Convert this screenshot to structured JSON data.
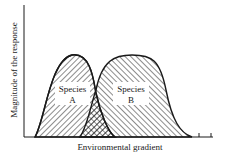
{
  "figure": {
    "y_axis_label": "Magnitude of the response",
    "x_axis_label": "Environmental gradient",
    "species": [
      {
        "name": "Species",
        "letter": "A",
        "hatch": "backslash"
      },
      {
        "name": "Species",
        "letter": "B",
        "hatch": "forwardslash"
      }
    ],
    "overlap_fill": "cross-hatch",
    "colors": {
      "ink": "#1a1a1a",
      "background": "#ffffff"
    }
  }
}
